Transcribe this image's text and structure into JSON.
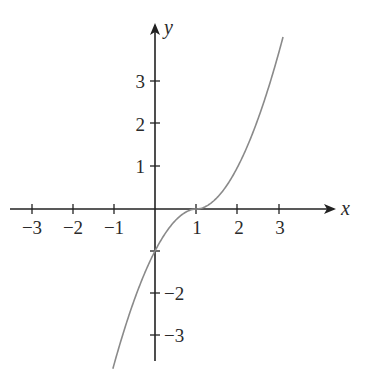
{
  "chart_data": {
    "type": "line",
    "title": "",
    "xlabel": "x",
    "ylabel": "y",
    "xlim": [
      -3.6,
      4.3
    ],
    "ylim": [
      -3.6,
      4.3
    ],
    "grid": false,
    "legend": null,
    "x_ticks": [
      -3,
      -2,
      -1,
      1,
      2,
      3
    ],
    "y_ticks": [
      -3,
      -2,
      -1,
      1,
      2,
      3
    ],
    "x_tick_labels": [
      "−3",
      "−2",
      "−1",
      "1",
      "2",
      "3"
    ],
    "y_tick_labels": [
      "3",
      "2",
      "1",
      "−2",
      "−3"
    ],
    "series": [
      {
        "name": "curve",
        "description": "Increasing curve with horizontal inflection at (1, 0), crossing y-axis at (0, -1)",
        "x": [
          -1.0,
          -0.5,
          0.0,
          0.5,
          1.0,
          1.5,
          2.0,
          2.5,
          3.0,
          3.1
        ],
        "values": [
          -3.7,
          -2.2,
          -1.0,
          -0.27,
          0.0,
          0.27,
          1.0,
          2.2,
          3.7,
          4.1
        ]
      }
    ],
    "key_points": [
      {
        "x": 0,
        "y": -1,
        "note": "y-intercept"
      },
      {
        "x": 1,
        "y": 0,
        "note": "x-intercept / inflection point"
      }
    ],
    "colors": {
      "axes": "#222222",
      "curve": "#8a8a8a",
      "text": "#2a2a2a"
    }
  },
  "axes": {
    "x_name": "x",
    "y_name": "y"
  },
  "labels": {
    "x": {
      "m3": "−3",
      "m2": "−2",
      "m1": "−1",
      "p1": "1",
      "p2": "2",
      "p3": "3"
    },
    "y": {
      "p3": "3",
      "p2": "2",
      "p1": "1",
      "m2": "−2",
      "m3": "−3"
    }
  }
}
